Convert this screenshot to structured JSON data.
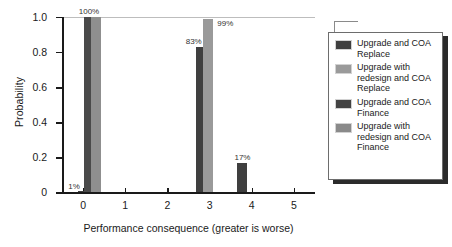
{
  "chart_data": {
    "type": "bar",
    "title": "",
    "xlabel": "Performance consequence (greater is worse)",
    "ylabel": "Probability",
    "xlim": [
      -0.5,
      5.5
    ],
    "ylim": [
      0,
      1.0
    ],
    "grid": "top-gridline-only",
    "legend_position": "right",
    "x_ticks": [
      "0",
      "1",
      "2",
      "3",
      "4",
      "5"
    ],
    "y_ticks": [
      "0",
      "0.2",
      "0.4",
      "0.6",
      "0.8",
      "1.0"
    ],
    "categories": [
      "0",
      "1",
      "2",
      "3",
      "4",
      "5"
    ],
    "series": [
      {
        "name": "Upgrade and COA Replace",
        "color": "#3f3f3f",
        "values": [
          0.01,
          0,
          0,
          0.83,
          0,
          0
        ]
      },
      {
        "name": "Upgrade with redesign and COA Replace",
        "color": "#9a9a9a",
        "values": [
          0,
          0,
          0,
          0.99,
          0,
          0
        ]
      },
      {
        "name": "Upgrade and COA Finance",
        "color": "#3f3f3f",
        "values": [
          1.0,
          0,
          0,
          0,
          0.17,
          0
        ]
      },
      {
        "name": "Upgrade with redesign and COA Finance",
        "color": "#8f8f8f",
        "values": [
          1.0,
          0,
          0,
          0,
          0,
          0
        ]
      }
    ],
    "bars": [
      {
        "label": "1%",
        "x": 0.0,
        "value": 0.01,
        "series": "Upgrade and COA Replace",
        "color": "#3f3f3f"
      },
      {
        "label": "100%",
        "x": 0.14,
        "value": 1.0,
        "series": "Upgrade and COA Finance",
        "color": "#4a4a4a"
      },
      {
        "label": "",
        "x": 0.3,
        "value": 1.0,
        "series": "Upgrade with redesign and COA Finance",
        "color": "#8f8f8f"
      },
      {
        "label": "83%",
        "x": 2.79,
        "value": 0.83,
        "series": "Upgrade and COA Replace",
        "color": "#3f3f3f"
      },
      {
        "label": "99%",
        "x": 2.97,
        "value": 0.99,
        "series": "Upgrade with redesign and COA Replace",
        "color": "#9a9a9a"
      },
      {
        "label": "17%",
        "x": 3.78,
        "value": 0.17,
        "series": "Upgrade and COA Finance",
        "color": "#3f3f3f"
      }
    ]
  },
  "legend": {
    "items": [
      {
        "label": "Upgrade and COA Replace",
        "color": "#3f3f3f"
      },
      {
        "label": "Upgrade with redesign and COA Replace",
        "color": "#9a9a9a"
      },
      {
        "label": "Upgrade and COA Finance",
        "color": "#434343"
      },
      {
        "label": "Upgrade with redesign and COA Finance",
        "color": "#8a8a8a"
      }
    ]
  }
}
